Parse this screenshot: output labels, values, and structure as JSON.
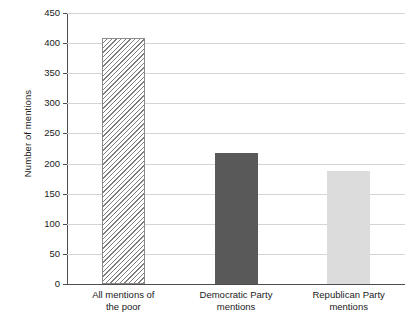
{
  "chart_data": {
    "type": "bar",
    "title": "",
    "subtitle": "",
    "xlabel": "",
    "ylabel": "Number of mentions",
    "ylim": [
      0,
      450
    ],
    "yticks": [
      0,
      50,
      100,
      150,
      200,
      250,
      300,
      350,
      400,
      450
    ],
    "ytick_labels": [
      "0",
      "50",
      "100",
      "150",
      "200",
      "250",
      "300",
      "350",
      "400",
      "450"
    ],
    "grid": "horizontal",
    "legend": "none",
    "categories": [
      "All mentions of the poor",
      "Democratic Party mentions",
      "Republican Party mentions"
    ],
    "category_lines": [
      [
        "All mentions of",
        "the poor"
      ],
      [
        "Democratic Party",
        "mentions"
      ],
      [
        "Republican Party",
        "mentions"
      ]
    ],
    "values": [
      408,
      217,
      188
    ],
    "bar_styles": [
      "diagonal-hatch",
      "solid-dark-gray",
      "solid-light-gray"
    ],
    "colors": {
      "bar_hatch_line": "#7d7d7d",
      "bar_hatch_fill": "#ffffff",
      "bar_dark": "#595959",
      "bar_light": "#dcdcdc",
      "gridline": "#d4d4d4",
      "axis": "#4d4d4d",
      "text": "#1a1a1a",
      "background": "#ffffff"
    }
  }
}
